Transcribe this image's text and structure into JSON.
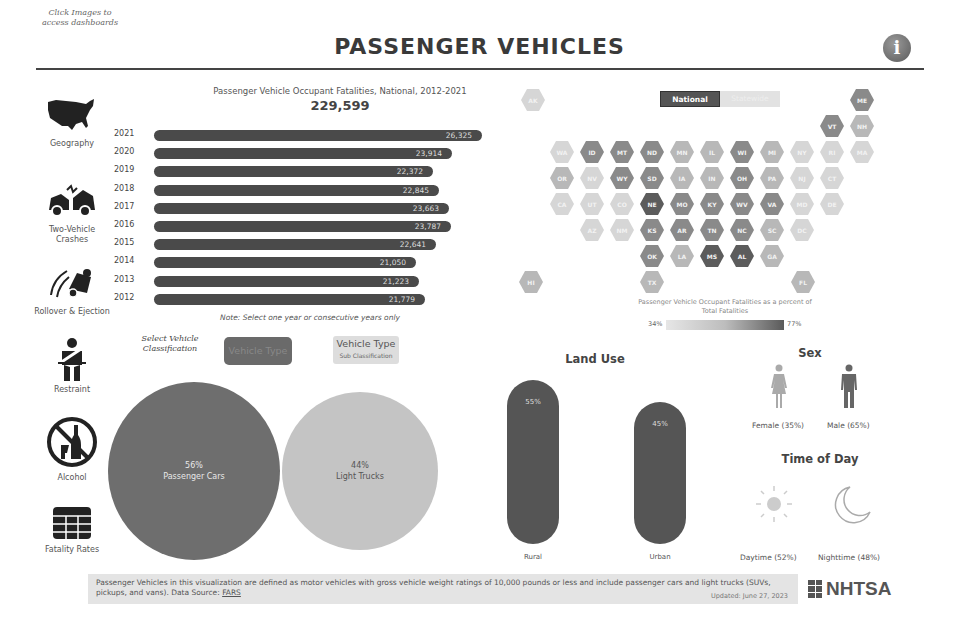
{
  "header": {
    "click_note": "Click Images to access dashboards",
    "title": "PASSENGER  VEHICLES",
    "info_icon": "i"
  },
  "sidebar": {
    "items": [
      {
        "label": "Geography",
        "icon": "us-map-icon"
      },
      {
        "label": "Two-Vehicle Crashes",
        "icon": "two-vehicle-crash-icon"
      },
      {
        "label": "Rollover & Ejection",
        "icon": "rollover-icon"
      },
      {
        "label": "Restraint",
        "icon": "seatbelt-icon"
      },
      {
        "label": "Alcohol",
        "icon": "no-alcohol-icon"
      },
      {
        "label": "Fatality Rates",
        "icon": "table-grid-icon"
      }
    ]
  },
  "bar_chart": {
    "title": "Passenger Vehicle Occupant Fatalities, National, 2012-2021",
    "total": "229,599",
    "note": "Note: Select one year or consecutive years only"
  },
  "chart_data": [
    {
      "type": "bar",
      "title": "Passenger Vehicle Occupant Fatalities, National, 2012-2021",
      "subtitle": "229,599",
      "orientation": "horizontal",
      "categories": [
        "2021",
        "2020",
        "2019",
        "2018",
        "2017",
        "2016",
        "2015",
        "2014",
        "2013",
        "2012"
      ],
      "values": [
        26325,
        23914,
        22372,
        22845,
        23663,
        23787,
        22641,
        21050,
        21223,
        21779
      ],
      "labels": [
        "26,325",
        "23,914",
        "22,372",
        "22,845",
        "23,663",
        "23,787",
        "22,641",
        "21,050",
        "21,223",
        "21,779"
      ],
      "xlabel": "",
      "ylabel": "",
      "grid": false
    },
    {
      "type": "bubble",
      "title": "Vehicle Type",
      "categories": [
        "Passenger Cars",
        "Light Trucks"
      ],
      "values": [
        56,
        44
      ],
      "labels": [
        "56%",
        "44%"
      ]
    },
    {
      "type": "bar",
      "title": "Land Use",
      "categories": [
        "Rural",
        "Urban"
      ],
      "values": [
        55,
        45
      ],
      "labels": [
        "55%",
        "45%"
      ]
    },
    {
      "type": "pictograph",
      "title": "Sex",
      "categories": [
        "Female",
        "Male"
      ],
      "values": [
        35,
        65
      ]
    },
    {
      "type": "pictograph",
      "title": "Time of Day",
      "categories": [
        "Daytime",
        "Nighttime"
      ],
      "values": [
        52,
        48
      ]
    },
    {
      "type": "heatmap",
      "title": "Passenger Vehicle Occupant Fatalities as a percent of Total Fatalities",
      "range": [
        "34%",
        "77%"
      ]
    }
  ],
  "bars": [
    {
      "year": "2021",
      "value": "26,325",
      "width": 328
    },
    {
      "year": "2020",
      "value": "23,914",
      "width": 298
    },
    {
      "year": "2019",
      "value": "22,372",
      "width": 279
    },
    {
      "year": "2018",
      "value": "22,845",
      "width": 285
    },
    {
      "year": "2017",
      "value": "23,663",
      "width": 295
    },
    {
      "year": "2016",
      "value": "23,787",
      "width": 297
    },
    {
      "year": "2015",
      "value": "22,641",
      "width": 282
    },
    {
      "year": "2014",
      "value": "21,050",
      "width": 262
    },
    {
      "year": "2013",
      "value": "21,223",
      "width": 265
    },
    {
      "year": "2012",
      "value": "21,779",
      "width": 271
    }
  ],
  "classification": {
    "select_label": "Select Vehicle Classification",
    "vehicle_type": "Vehicle Type",
    "vehicle_type_sub": "Vehicle Type",
    "vehicle_type_sub_caption": "Sub Classification",
    "cars_pct": "56%",
    "cars_label": "Passenger Cars",
    "trucks_pct": "44%",
    "trucks_label": "Light Trucks"
  },
  "map": {
    "toggle_national": "National",
    "toggle_state": "Statewide",
    "legend_title": "Passenger Vehicle Occupant Fatalities as a percent of Total Fatalities",
    "legend_min": "34%",
    "legend_max": "77%",
    "colors": {
      "dark": "#5c5c5c",
      "mid": "#8a8a8a",
      "light": "#b8b8b8",
      "pale": "#d6d6d6"
    },
    "states": [
      {
        "abbr": "AK",
        "x": 521,
        "y": 89,
        "shade": "pale"
      },
      {
        "abbr": "ME",
        "x": 850,
        "y": 89,
        "shade": "mid"
      },
      {
        "abbr": "VT",
        "x": 820,
        "y": 115,
        "shade": "mid"
      },
      {
        "abbr": "NH",
        "x": 850,
        "y": 115,
        "shade": "light"
      },
      {
        "abbr": "WA",
        "x": 550,
        "y": 141,
        "shade": "pale"
      },
      {
        "abbr": "ID",
        "x": 580,
        "y": 141,
        "shade": "mid"
      },
      {
        "abbr": "MT",
        "x": 610,
        "y": 141,
        "shade": "mid"
      },
      {
        "abbr": "ND",
        "x": 640,
        "y": 141,
        "shade": "mid"
      },
      {
        "abbr": "MN",
        "x": 670,
        "y": 141,
        "shade": "light"
      },
      {
        "abbr": "IL",
        "x": 700,
        "y": 141,
        "shade": "light"
      },
      {
        "abbr": "WI",
        "x": 730,
        "y": 141,
        "shade": "mid"
      },
      {
        "abbr": "MI",
        "x": 760,
        "y": 141,
        "shade": "light"
      },
      {
        "abbr": "NY",
        "x": 790,
        "y": 141,
        "shade": "pale"
      },
      {
        "abbr": "RI",
        "x": 820,
        "y": 141,
        "shade": "pale"
      },
      {
        "abbr": "MA",
        "x": 850,
        "y": 141,
        "shade": "pale"
      },
      {
        "abbr": "OR",
        "x": 550,
        "y": 167,
        "shade": "light"
      },
      {
        "abbr": "NV",
        "x": 580,
        "y": 167,
        "shade": "pale"
      },
      {
        "abbr": "WY",
        "x": 610,
        "y": 167,
        "shade": "mid"
      },
      {
        "abbr": "SD",
        "x": 640,
        "y": 167,
        "shade": "mid"
      },
      {
        "abbr": "IA",
        "x": 670,
        "y": 167,
        "shade": "light"
      },
      {
        "abbr": "IN",
        "x": 700,
        "y": 167,
        "shade": "light"
      },
      {
        "abbr": "OH",
        "x": 730,
        "y": 167,
        "shade": "mid"
      },
      {
        "abbr": "PA",
        "x": 760,
        "y": 167,
        "shade": "light"
      },
      {
        "abbr": "NJ",
        "x": 790,
        "y": 167,
        "shade": "pale"
      },
      {
        "abbr": "CT",
        "x": 820,
        "y": 167,
        "shade": "pale"
      },
      {
        "abbr": "CA",
        "x": 550,
        "y": 193,
        "shade": "pale"
      },
      {
        "abbr": "UT",
        "x": 580,
        "y": 193,
        "shade": "pale"
      },
      {
        "abbr": "CO",
        "x": 610,
        "y": 193,
        "shade": "pale"
      },
      {
        "abbr": "NE",
        "x": 640,
        "y": 193,
        "shade": "dark"
      },
      {
        "abbr": "MO",
        "x": 670,
        "y": 193,
        "shade": "mid"
      },
      {
        "abbr": "KY",
        "x": 700,
        "y": 193,
        "shade": "mid"
      },
      {
        "abbr": "WV",
        "x": 730,
        "y": 193,
        "shade": "mid"
      },
      {
        "abbr": "VA",
        "x": 760,
        "y": 193,
        "shade": "mid"
      },
      {
        "abbr": "MD",
        "x": 790,
        "y": 193,
        "shade": "pale"
      },
      {
        "abbr": "DE",
        "x": 820,
        "y": 193,
        "shade": "pale"
      },
      {
        "abbr": "AZ",
        "x": 580,
        "y": 219,
        "shade": "pale"
      },
      {
        "abbr": "NM",
        "x": 610,
        "y": 219,
        "shade": "pale"
      },
      {
        "abbr": "KS",
        "x": 640,
        "y": 219,
        "shade": "mid"
      },
      {
        "abbr": "AR",
        "x": 670,
        "y": 219,
        "shade": "mid"
      },
      {
        "abbr": "TN",
        "x": 700,
        "y": 219,
        "shade": "mid"
      },
      {
        "abbr": "NC",
        "x": 730,
        "y": 219,
        "shade": "mid"
      },
      {
        "abbr": "SC",
        "x": 760,
        "y": 219,
        "shade": "light"
      },
      {
        "abbr": "DC",
        "x": 790,
        "y": 219,
        "shade": "pale"
      },
      {
        "abbr": "OK",
        "x": 640,
        "y": 245,
        "shade": "mid"
      },
      {
        "abbr": "LA",
        "x": 670,
        "y": 245,
        "shade": "light"
      },
      {
        "abbr": "MS",
        "x": 700,
        "y": 245,
        "shade": "dark"
      },
      {
        "abbr": "AL",
        "x": 730,
        "y": 245,
        "shade": "dark"
      },
      {
        "abbr": "GA",
        "x": 760,
        "y": 245,
        "shade": "light"
      },
      {
        "abbr": "HI",
        "x": 519,
        "y": 271,
        "shade": "light"
      },
      {
        "abbr": "TX",
        "x": 640,
        "y": 271,
        "shade": "light"
      },
      {
        "abbr": "FL",
        "x": 791,
        "y": 271,
        "shade": "light"
      }
    ]
  },
  "land_use": {
    "title": "Land Use",
    "rural_pct": "55%",
    "rural_label": "Rural",
    "urban_pct": "45%",
    "urban_label": "Urban"
  },
  "sex": {
    "title": "Sex",
    "female_label": "Female (35%)",
    "male_label": "Male (65%)"
  },
  "time_of_day": {
    "title": "Time of Day",
    "day_label": "Daytime (52%)",
    "night_label": "Nighttime (48%)"
  },
  "footer": {
    "text": "Passenger Vehicles in this visualization are defined as motor vehicles with gross vehicle weight ratings of 10,000 pounds or less and include passenger cars and light trucks (SUVs, pickups, and vans). Data Source: ",
    "source_link": "FARS",
    "updated": "Updated: June 27, 2023",
    "logo": "NHTSA"
  }
}
